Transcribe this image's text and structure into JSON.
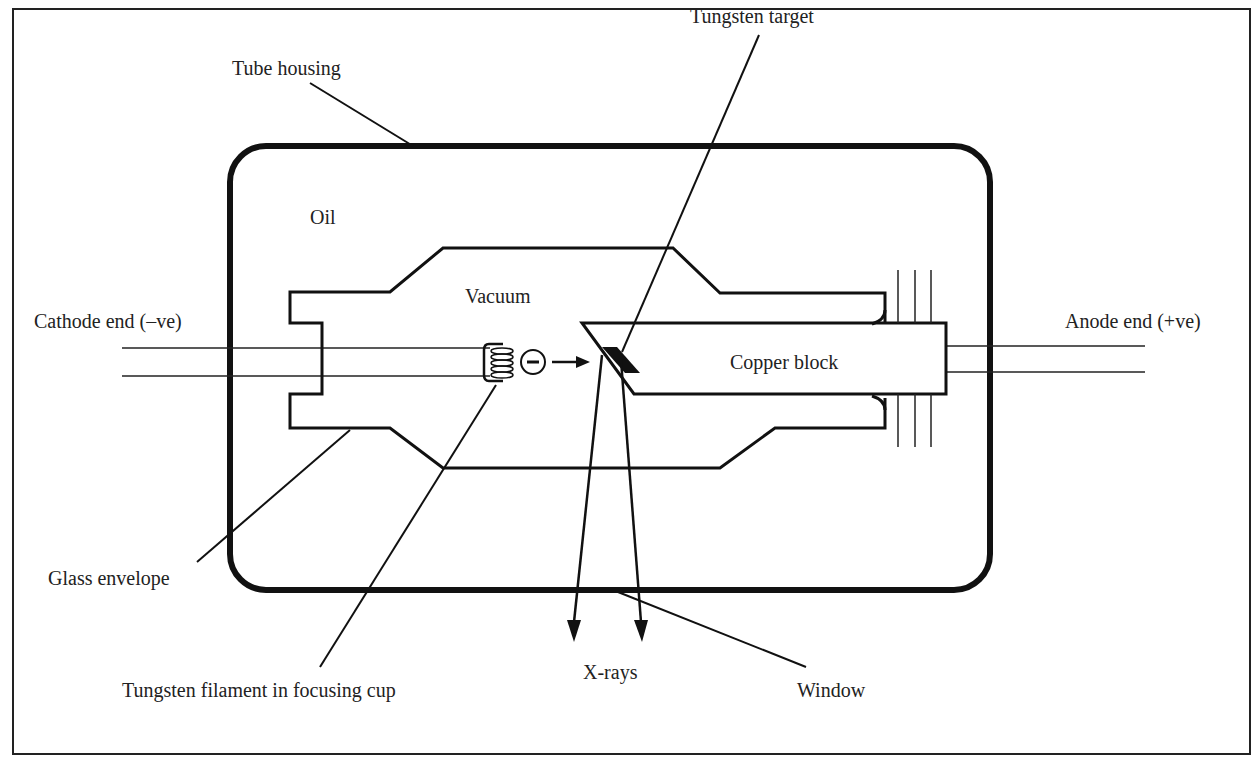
{
  "diagram": {
    "labels": {
      "tube_housing": "Tube housing",
      "tungsten_target": "Tungsten target",
      "oil": "Oil",
      "vacuum": "Vacuum",
      "cathode_end": "Cathode end (–ve)",
      "anode_end": "Anode end (+ve)",
      "copper_block": "Copper block",
      "glass_envelope": "Glass envelope",
      "tungsten_filament": "Tungsten filament in focusing cup",
      "x_rays": "X-rays",
      "window": "Window"
    },
    "electron_symbol": "−"
  }
}
